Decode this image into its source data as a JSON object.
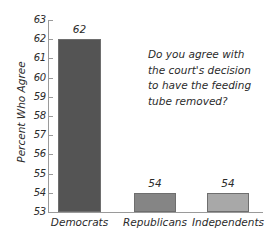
{
  "chart_data": {
    "type": "bar",
    "title": "",
    "xlabel": "",
    "ylabel": "Percent Who Agree",
    "categories": [
      "Democrats",
      "Republicans",
      "Independents"
    ],
    "values": [
      62,
      54,
      54
    ],
    "value_labels": [
      "62",
      "54",
      "54"
    ],
    "ylim": [
      53,
      63
    ],
    "ytick_labels": [
      "63",
      "62",
      "61",
      "60",
      "59",
      "58",
      "57",
      "56",
      "55",
      "54",
      "53"
    ],
    "ytick_values": [
      63,
      62,
      61,
      60,
      59,
      58,
      57,
      56,
      55,
      54,
      53
    ],
    "grid": false,
    "legend": "none",
    "annotation": "Do you agree with the court's decision to have the feeding tube removed?",
    "annotation_lines": [
      "Do you agree with",
      "the court's decision",
      "to have the feeding",
      "tube removed?"
    ],
    "bar_colors": [
      "#545454",
      "#858585",
      "#a8a8a8"
    ],
    "bar_border_color": "#6e6e6e",
    "axis_color": "#9a9a9a",
    "text_color": "#2b2b2b",
    "background_color": "#ffffff"
  }
}
